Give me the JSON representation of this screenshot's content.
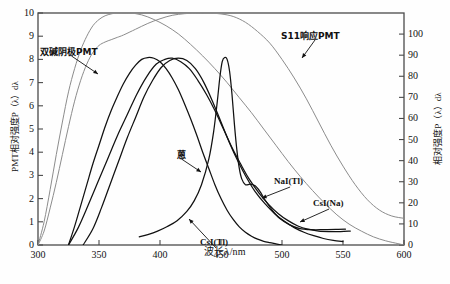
{
  "chart_data": {
    "type": "line",
    "title": "",
    "xlabel": "波长λ/nm",
    "ylabel_left": "PMT相对强度P（λ）dλ",
    "ylabel_right": "相对强度P（λ）dλ",
    "xlim": [
      300,
      600
    ],
    "ylim_left": [
      0,
      10
    ],
    "ylim_right": [
      0,
      110
    ],
    "xticks": [
      300,
      350,
      400,
      450,
      500,
      550,
      600
    ],
    "yticks_left": [
      0,
      1,
      2,
      3,
      4,
      5,
      6,
      7,
      8,
      9,
      10
    ],
    "yticks_right": [
      0,
      10,
      20,
      30,
      40,
      50,
      60,
      70,
      80,
      90,
      100
    ],
    "grid": false,
    "legend": "inline-annotations",
    "colors": {
      "pmt_curve": "#8c8c8c",
      "scintillator_curve": "#111111",
      "frame": "#4a4a4a"
    },
    "series": [
      {
        "name": "双碱阴极PMT",
        "axis": "left",
        "color": "#8c8c8c",
        "label_text": "双碱阴极PMT",
        "points": [
          [
            300,
            0.0
          ],
          [
            305,
            0.6
          ],
          [
            310,
            1.6
          ],
          [
            315,
            2.7
          ],
          [
            320,
            3.9
          ],
          [
            325,
            5.1
          ],
          [
            330,
            6.2
          ],
          [
            335,
            7.1
          ],
          [
            340,
            7.8
          ],
          [
            345,
            8.3
          ],
          [
            350,
            8.6
          ],
          [
            355,
            8.75
          ],
          [
            360,
            8.85
          ],
          [
            365,
            8.95
          ],
          [
            370,
            9.05
          ],
          [
            380,
            9.3
          ],
          [
            390,
            9.55
          ],
          [
            400,
            9.75
          ],
          [
            410,
            9.9
          ],
          [
            420,
            9.97
          ],
          [
            430,
            10.0
          ],
          [
            440,
            10.0
          ],
          [
            450,
            9.96
          ],
          [
            460,
            9.85
          ],
          [
            470,
            9.6
          ],
          [
            480,
            9.2
          ],
          [
            490,
            8.7
          ],
          [
            500,
            8.0
          ],
          [
            510,
            7.2
          ],
          [
            520,
            6.3
          ],
          [
            530,
            5.3
          ],
          [
            540,
            4.3
          ],
          [
            550,
            3.4
          ],
          [
            560,
            2.6
          ],
          [
            570,
            1.95
          ],
          [
            580,
            1.5
          ],
          [
            590,
            1.25
          ],
          [
            600,
            1.15
          ]
        ]
      },
      {
        "name": "S11响应PMT",
        "axis": "left",
        "color": "#8c8c8c",
        "label_text": "S11响应PMT",
        "points": [
          [
            300,
            0.0
          ],
          [
            305,
            1.0
          ],
          [
            310,
            2.4
          ],
          [
            315,
            3.9
          ],
          [
            320,
            5.3
          ],
          [
            325,
            6.6
          ],
          [
            330,
            7.6
          ],
          [
            335,
            8.4
          ],
          [
            340,
            9.0
          ],
          [
            345,
            9.45
          ],
          [
            350,
            9.72
          ],
          [
            355,
            9.88
          ],
          [
            360,
            9.96
          ],
          [
            365,
            10.0
          ],
          [
            375,
            10.0
          ],
          [
            385,
            9.92
          ],
          [
            395,
            9.72
          ],
          [
            405,
            9.45
          ],
          [
            415,
            9.1
          ],
          [
            425,
            8.65
          ],
          [
            435,
            8.15
          ],
          [
            445,
            7.6
          ],
          [
            455,
            7.0
          ],
          [
            465,
            6.35
          ],
          [
            475,
            5.7
          ],
          [
            485,
            5.0
          ],
          [
            495,
            4.3
          ],
          [
            505,
            3.6
          ],
          [
            515,
            2.95
          ],
          [
            525,
            2.35
          ],
          [
            535,
            1.8
          ],
          [
            545,
            1.3
          ],
          [
            555,
            0.9
          ],
          [
            565,
            0.6
          ],
          [
            575,
            0.35
          ],
          [
            585,
            0.18
          ],
          [
            595,
            0.06
          ],
          [
            600,
            0.0
          ]
        ]
      },
      {
        "name": "蒽",
        "axis": "left",
        "color": "#111111",
        "label_text": "蒽",
        "points": [
          [
            325,
            0.0
          ],
          [
            330,
            0.8
          ],
          [
            335,
            1.7
          ],
          [
            340,
            2.6
          ],
          [
            345,
            3.5
          ],
          [
            350,
            4.3
          ],
          [
            355,
            5.1
          ],
          [
            360,
            5.8
          ],
          [
            365,
            6.4
          ],
          [
            370,
            6.95
          ],
          [
            375,
            7.4
          ],
          [
            380,
            7.75
          ],
          [
            385,
            8.0
          ],
          [
            390,
            8.08
          ],
          [
            395,
            8.05
          ],
          [
            400,
            7.9
          ],
          [
            405,
            7.6
          ],
          [
            410,
            7.2
          ],
          [
            415,
            6.7
          ],
          [
            420,
            6.1
          ],
          [
            425,
            5.45
          ],
          [
            430,
            4.75
          ],
          [
            435,
            4.0
          ],
          [
            440,
            3.3
          ],
          [
            445,
            2.6
          ],
          [
            450,
            2.0
          ],
          [
            455,
            1.5
          ],
          [
            460,
            1.1
          ],
          [
            465,
            0.78
          ],
          [
            470,
            0.55
          ],
          [
            475,
            0.38
          ],
          [
            480,
            0.25
          ],
          [
            485,
            0.16
          ],
          [
            490,
            0.1
          ],
          [
            495,
            0.05
          ],
          [
            500,
            0.0
          ]
        ]
      },
      {
        "name": "CsI(Tl)",
        "axis": "left",
        "color": "#111111",
        "label_text": "CsI(Tl)",
        "points": [
          [
            383,
            0.35
          ],
          [
            390,
            0.45
          ],
          [
            398,
            0.6
          ],
          [
            406,
            0.8
          ],
          [
            414,
            1.05
          ],
          [
            422,
            1.45
          ],
          [
            428,
            1.9
          ],
          [
            434,
            2.6
          ],
          [
            440,
            3.7
          ],
          [
            444,
            4.9
          ],
          [
            447,
            6.2
          ],
          [
            449,
            7.2
          ],
          [
            451,
            7.9
          ],
          [
            453,
            8.08
          ],
          [
            455,
            8.0
          ],
          [
            457,
            7.5
          ],
          [
            459,
            6.5
          ],
          [
            461,
            5.2
          ],
          [
            463,
            4.1
          ],
          [
            465,
            3.3
          ],
          [
            467,
            2.85
          ],
          [
            470,
            2.6
          ],
          [
            474,
            2.62
          ],
          [
            478,
            2.55
          ],
          [
            482,
            2.3
          ],
          [
            486,
            1.95
          ],
          [
            492,
            1.5
          ],
          [
            498,
            1.15
          ],
          [
            506,
            0.88
          ],
          [
            514,
            0.72
          ],
          [
            524,
            0.66
          ],
          [
            534,
            0.66
          ],
          [
            544,
            0.67
          ],
          [
            552,
            0.68
          ]
        ]
      },
      {
        "name": "NaI(Tl)",
        "axis": "left",
        "color": "#111111",
        "label_text": "NaI(Tl)",
        "points": [
          [
            337,
            0.0
          ],
          [
            345,
            0.7
          ],
          [
            352,
            1.6
          ],
          [
            359,
            2.6
          ],
          [
            366,
            3.6
          ],
          [
            373,
            4.6
          ],
          [
            380,
            5.5
          ],
          [
            387,
            6.4
          ],
          [
            394,
            7.1
          ],
          [
            401,
            7.65
          ],
          [
            408,
            7.95
          ],
          [
            415,
            8.05
          ],
          [
            422,
            7.95
          ],
          [
            429,
            7.6
          ],
          [
            436,
            7.0
          ],
          [
            443,
            6.2
          ],
          [
            450,
            5.3
          ],
          [
            457,
            4.4
          ],
          [
            464,
            3.6
          ],
          [
            471,
            2.9
          ],
          [
            478,
            2.3
          ],
          [
            486,
            1.78
          ],
          [
            494,
            1.35
          ],
          [
            502,
            1.02
          ],
          [
            510,
            0.75
          ],
          [
            518,
            0.55
          ],
          [
            526,
            0.4
          ],
          [
            534,
            0.28
          ],
          [
            542,
            0.2
          ],
          [
            550,
            0.15
          ]
        ]
      },
      {
        "name": "CsI(Na)",
        "axis": "left",
        "color": "#111111",
        "label_text": "CsI(Na)",
        "points": [
          [
            325,
            0.0
          ],
          [
            333,
            0.75
          ],
          [
            341,
            1.7
          ],
          [
            349,
            2.7
          ],
          [
            357,
            3.7
          ],
          [
            365,
            4.7
          ],
          [
            373,
            5.6
          ],
          [
            381,
            6.5
          ],
          [
            389,
            7.25
          ],
          [
            397,
            7.8
          ],
          [
            404,
            8.0
          ],
          [
            410,
            8.05
          ],
          [
            417,
            7.9
          ],
          [
            424,
            7.6
          ],
          [
            431,
            7.1
          ],
          [
            438,
            6.5
          ],
          [
            445,
            5.8
          ],
          [
            452,
            5.0
          ],
          [
            459,
            4.2
          ],
          [
            466,
            3.5
          ],
          [
            473,
            2.85
          ],
          [
            481,
            2.25
          ],
          [
            489,
            1.75
          ],
          [
            497,
            1.35
          ],
          [
            505,
            1.05
          ],
          [
            513,
            0.82
          ],
          [
            521,
            0.68
          ],
          [
            530,
            0.6
          ],
          [
            540,
            0.58
          ],
          [
            548,
            0.58
          ],
          [
            556,
            0.6
          ]
        ]
      }
    ],
    "annotations": [
      {
        "text": "双碱阴极PMT",
        "lx": 40,
        "ly": 45,
        "ax": 98,
        "ay": 74
      },
      {
        "text": "S11响应PMT",
        "lx": 281,
        "ly": 29,
        "ax": 302,
        "ay": 58
      },
      {
        "text": "蒽",
        "lx": 177,
        "ly": 148,
        "ax": 201,
        "ay": 172
      },
      {
        "text": "CsI(Tl)",
        "lx": 200,
        "ly": 237,
        "ax": 189,
        "ay": 219
      },
      {
        "text": "NaI(Tl)",
        "lx": 274,
        "ly": 176,
        "ax": 262,
        "ay": 198
      },
      {
        "text": "CsI(Na)",
        "lx": 313,
        "ly": 198,
        "ax": 300,
        "ay": 222
      }
    ]
  },
  "axes": {
    "x_tick_labels": [
      "300",
      "350",
      "400",
      "450",
      "500",
      "550",
      "600"
    ],
    "y_left_tick_labels": [
      "0",
      "1",
      "2",
      "3",
      "4",
      "5",
      "6",
      "7",
      "8",
      "9",
      "10"
    ],
    "y_right_tick_labels": [
      "0",
      "10",
      "20",
      "30",
      "40",
      "50",
      "60",
      "70",
      "80",
      "90",
      "100"
    ],
    "x_title": "波长λ/nm",
    "y_left_title": "PMT相对强度P（λ）dλ",
    "y_right_title": "相对强度P（λ）dλ"
  }
}
